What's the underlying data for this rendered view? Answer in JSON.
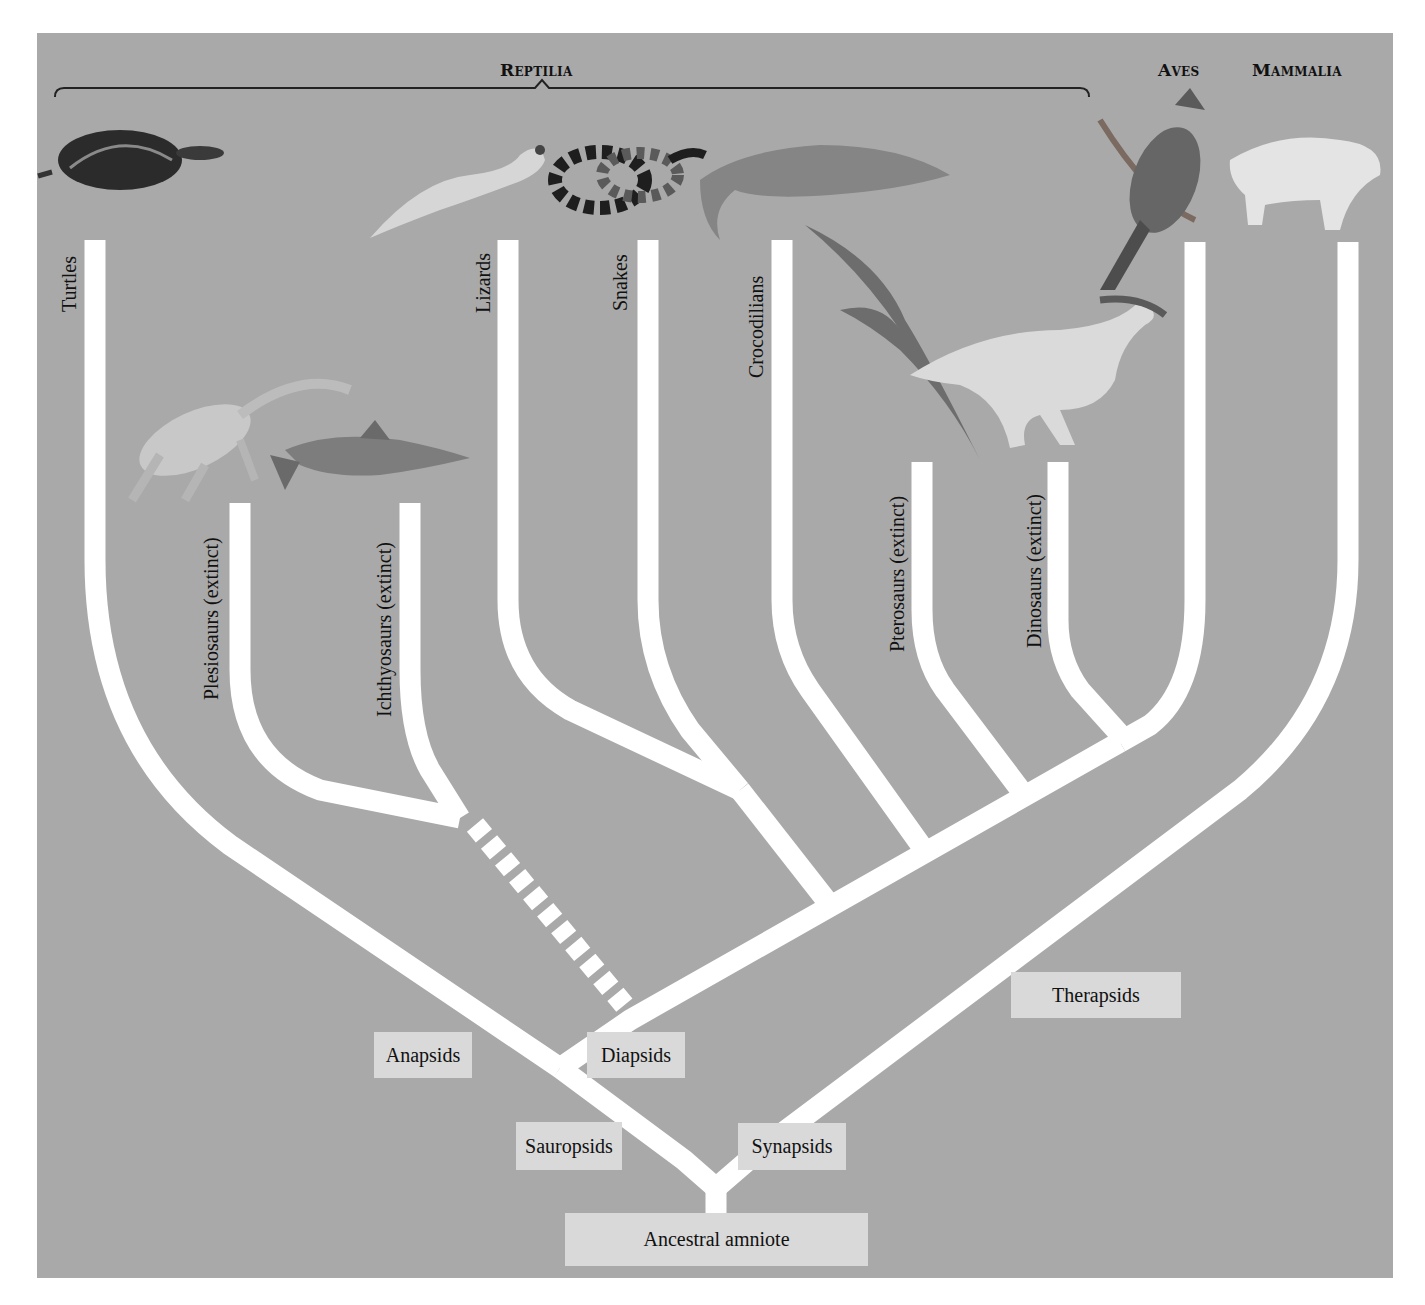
{
  "colors": {
    "background": "#a9a9a9",
    "branch": "#ffffff",
    "node_box": "#d9d9d9",
    "text": "#111111"
  },
  "groups": {
    "reptilia": "Reptilia",
    "aves": "Aves",
    "mammalia": "Mammalia"
  },
  "taxa": [
    {
      "name": "Turtles",
      "extinct": false,
      "image": "turtle"
    },
    {
      "name": "Plesiosaurs (extinct)",
      "extinct": true,
      "image": "plesiosaur"
    },
    {
      "name": "Ichthyosaurs (extinct)",
      "extinct": true,
      "image": "ichthyosaur"
    },
    {
      "name": "Lizards",
      "extinct": false,
      "image": "gecko"
    },
    {
      "name": "Snakes",
      "extinct": false,
      "image": "coral-snake"
    },
    {
      "name": "Crocodilians",
      "extinct": false,
      "image": "crocodile"
    },
    {
      "name": "Pterosaurs (extinct)",
      "extinct": true,
      "image": "pterosaur"
    },
    {
      "name": "Dinosaurs (extinct)",
      "extinct": true,
      "image": "hadrosaur"
    },
    {
      "name": "Aves",
      "extinct": false,
      "image": "cardinal"
    },
    {
      "name": "Mammalia",
      "extinct": false,
      "image": "bobcat"
    }
  ],
  "nodes": {
    "ancestral_amniote": "Ancestral amniote",
    "sauropsids": "Sauropsids",
    "synapsids": "Synapsids",
    "anapsids": "Anapsids",
    "diapsids": "Diapsids",
    "therapsids": "Therapsids"
  },
  "notes": {
    "uncertain_link": "Dashed branch connects Plesiosaurs + Ichthyosaurs clade to Diapsids"
  }
}
